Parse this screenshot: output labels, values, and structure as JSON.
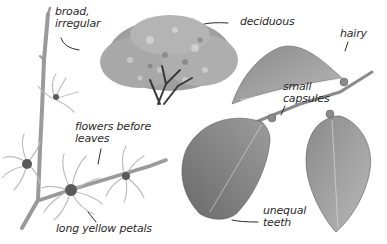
{
  "illustration": {
    "subject": "witch hazel",
    "colors": {
      "ink": "#2a2a2a",
      "stem": "#9a9a9a",
      "leaf_dark": "#6e6e6e",
      "leaf_light": "#b4b4b4",
      "foliage": "#8c8c8c",
      "petal": "#c8c8c8",
      "background": "#ffffff"
    }
  },
  "labels": {
    "form_line1": "broad,",
    "form_line2": "irregular",
    "deciduous": "deciduous",
    "hairy": "hairy",
    "capsules_line1": "small",
    "capsules_line2": "capsules",
    "flowers_line1": "flowers before",
    "flowers_line2": "leaves",
    "teeth_line1": "unequal",
    "teeth_line2": "teeth",
    "petals": "long yellow petals"
  }
}
